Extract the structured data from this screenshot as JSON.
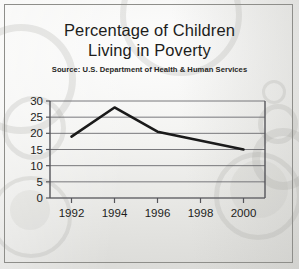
{
  "frame": {
    "border_color": "#8e8e8a",
    "background_color": "#eeeeec"
  },
  "title": {
    "line1": "Percentage of Children",
    "line2": "Living in Poverty",
    "source": "Source: U.S. Department of Health & Human Services"
  },
  "chart_data": {
    "type": "line",
    "title": "Percentage of Children Living in Poverty",
    "subtitle": "Source: U.S. Department of Health & Human Services",
    "xlabel": "",
    "ylabel": "",
    "xlim": [
      1991,
      2001
    ],
    "ylim": [
      0,
      30
    ],
    "grid": true,
    "grid_axis": "y",
    "legend": false,
    "line_color": "#1a1a1a",
    "x_ticks": [
      1992,
      1994,
      1996,
      1998,
      2000
    ],
    "x_tick_labels": [
      "1992",
      "1994",
      "1996",
      "1998",
      "2000"
    ],
    "y_ticks": [
      0,
      5,
      10,
      15,
      20,
      25,
      30
    ],
    "y_tick_labels": [
      "0",
      "5",
      "10",
      "15",
      "20",
      "25",
      "30"
    ],
    "series": [
      {
        "name": "Percentage of children living in poverty",
        "x": [
          1992,
          1994,
          1996,
          2000
        ],
        "values": [
          19.0,
          28.0,
          20.5,
          15.0
        ]
      }
    ],
    "x": [
      1992,
      1994,
      1996,
      2000
    ],
    "values": [
      19.0,
      28.0,
      20.5,
      15.0
    ]
  }
}
